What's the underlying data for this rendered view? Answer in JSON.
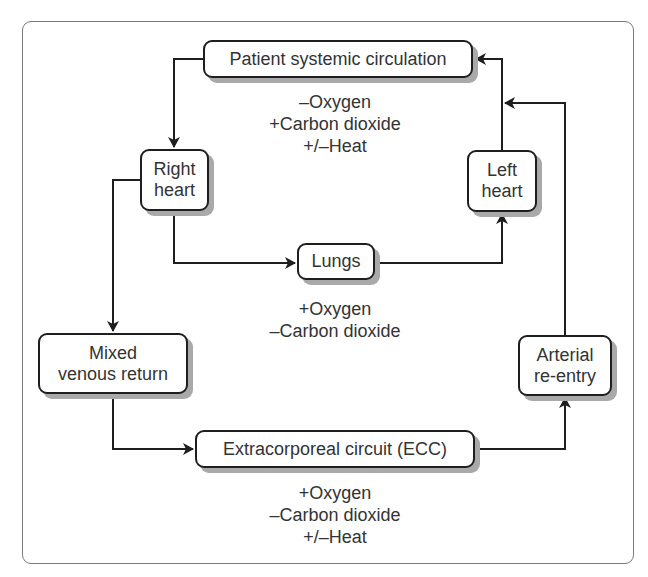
{
  "diagram": {
    "type": "flow",
    "nodes": {
      "patient": {
        "label": "Patient systemic circulation"
      },
      "right_heart": {
        "lines": [
          "Right",
          "heart"
        ]
      },
      "left_heart": {
        "lines": [
          "Left",
          "heart"
        ]
      },
      "lungs": {
        "label": "Lungs"
      },
      "mixed_venous": {
        "lines": [
          "Mixed",
          "venous return"
        ]
      },
      "arterial": {
        "lines": [
          "Arterial",
          "re-entry"
        ]
      },
      "ecc": {
        "label": "Extracorporeal circuit (ECC)"
      }
    },
    "annotations": {
      "systemic": [
        "–Oxygen",
        "+Carbon dioxide",
        "+/–Heat"
      ],
      "lungs": [
        "+Oxygen",
        "–Carbon dioxide"
      ],
      "ecc": [
        "+Oxygen",
        "–Carbon dioxide",
        "+/–Heat"
      ]
    },
    "edges": [
      {
        "from": "Patient systemic circulation",
        "to": "Right heart"
      },
      {
        "from": "Right heart",
        "to": "Lungs"
      },
      {
        "from": "Lungs",
        "to": "Left heart"
      },
      {
        "from": "Left heart",
        "to": "Patient systemic circulation"
      },
      {
        "from": "Right heart",
        "to": "Mixed venous return"
      },
      {
        "from": "Mixed venous return",
        "to": "Extracorporeal circuit (ECC)"
      },
      {
        "from": "Extracorporeal circuit (ECC)",
        "to": "Arterial re-entry"
      },
      {
        "from": "Arterial re-entry",
        "to": "Left heart"
      }
    ],
    "colors": {
      "line": "#1e1e1e",
      "shadow": "#a9a9a9",
      "frame": "#7a7a7a",
      "text": "#333333"
    }
  }
}
